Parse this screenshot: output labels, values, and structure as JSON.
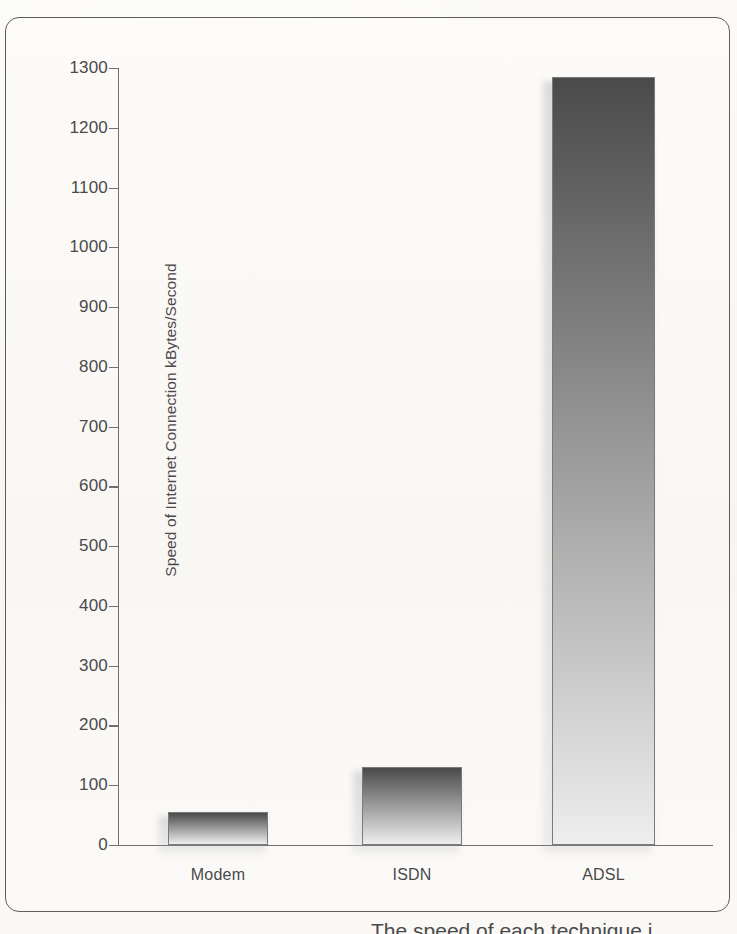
{
  "figure": {
    "caption_partial": "The speed of each technique i"
  },
  "chart_data": {
    "type": "bar",
    "title": "",
    "xlabel": "",
    "ylabel": "Speed of Internet Connection kBytes/Second",
    "categories": [
      "Modem",
      "ISDN",
      "ADSL"
    ],
    "values": [
      56,
      130,
      1285
    ],
    "ylim": [
      0,
      1300
    ],
    "ytick_step": 100,
    "yticks": [
      "0",
      "100",
      "200",
      "300",
      "400",
      "500",
      "600",
      "700",
      "800",
      "900",
      "1000",
      "1100",
      "1200",
      "1300"
    ],
    "grid": false,
    "legend": "none",
    "bar_style": {
      "gradient_top": "#4a4a4a",
      "gradient_bottom": "#eeeeee",
      "outline": "#7a7a7a"
    },
    "axis_color": "#6f6f6f",
    "text_color": "#4a4a4a",
    "background": "#faf9f6"
  }
}
